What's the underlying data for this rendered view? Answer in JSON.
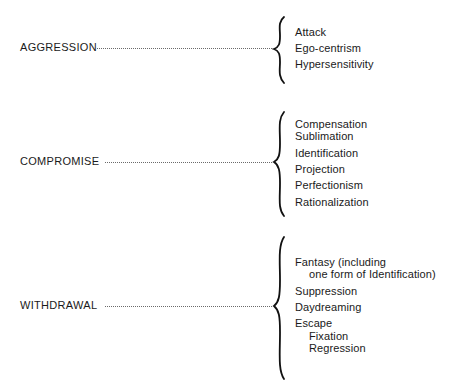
{
  "groups": [
    {
      "category": "AGGRESSION",
      "items": [
        {
          "label": "Attack",
          "indent": 0
        },
        {
          "label": "Ego-centrism",
          "indent": 0
        },
        {
          "label": "Hypersensitivity",
          "indent": 0
        }
      ]
    },
    {
      "category": "COMPROMISE",
      "items": [
        {
          "label": "Compensation",
          "indent": 0
        },
        {
          "label": "Sublimation",
          "indent": 0
        },
        {
          "label": "Identification",
          "indent": 0
        },
        {
          "label": "Projection",
          "indent": 0
        },
        {
          "label": "Perfectionism",
          "indent": 0
        },
        {
          "label": "Rationalization",
          "indent": 0
        }
      ]
    },
    {
      "category": "WITHDRAWAL",
      "items": [
        {
          "label": "Fantasy (including",
          "indent": 0
        },
        {
          "label": "one form of Identification)",
          "indent": 1
        },
        {
          "label": "Suppression",
          "indent": 0
        },
        {
          "label": "Daydreaming",
          "indent": 0
        },
        {
          "label": "Escape",
          "indent": 0
        },
        {
          "label": "Fixation",
          "indent": 1
        },
        {
          "label": "Regression",
          "indent": 1
        }
      ]
    }
  ]
}
